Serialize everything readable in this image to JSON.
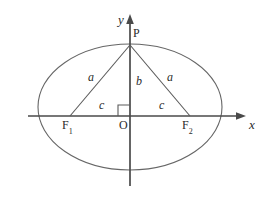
{
  "figure": {
    "kind": "ellipse-foci-diagram",
    "title": "",
    "stroke_color": "#555555",
    "axis_color": "#444444",
    "text_color": "#2b2b2b",
    "background": "#ffffff",
    "axes": {
      "x_label": "x",
      "y_label": "y",
      "origin_label": "O"
    },
    "points": [
      {
        "name": "origin",
        "label": "O",
        "x": 130,
        "y": 116
      },
      {
        "name": "apex",
        "label": "P",
        "x": 130,
        "y": 45
      },
      {
        "name": "left-focus",
        "label": "F",
        "subscript": "1",
        "x": 70,
        "y": 116
      },
      {
        "name": "right-focus",
        "label": "F",
        "subscript": "2",
        "x": 190,
        "y": 116
      }
    ],
    "segments": [
      {
        "name": "left-hypotenuse",
        "label": "a",
        "from": "left-focus",
        "to": "apex"
      },
      {
        "name": "right-hypotenuse",
        "label": "a",
        "from": "right-focus",
        "to": "apex"
      },
      {
        "name": "semi-minor-axis",
        "label": "b",
        "from": "origin",
        "to": "apex"
      },
      {
        "name": "left-focal-distance",
        "label": "c",
        "from": "left-focus",
        "to": "origin"
      },
      {
        "name": "right-focal-distance",
        "label": "c",
        "from": "origin",
        "to": "right-focus"
      }
    ],
    "right_angle_marker": {
      "name": "right-angle-at-origin",
      "present": true,
      "vertex": "origin"
    },
    "ellipse": {
      "center_x": 130,
      "center_y": 107,
      "semi_major_x": 92,
      "semi_minor_y": 63
    }
  }
}
